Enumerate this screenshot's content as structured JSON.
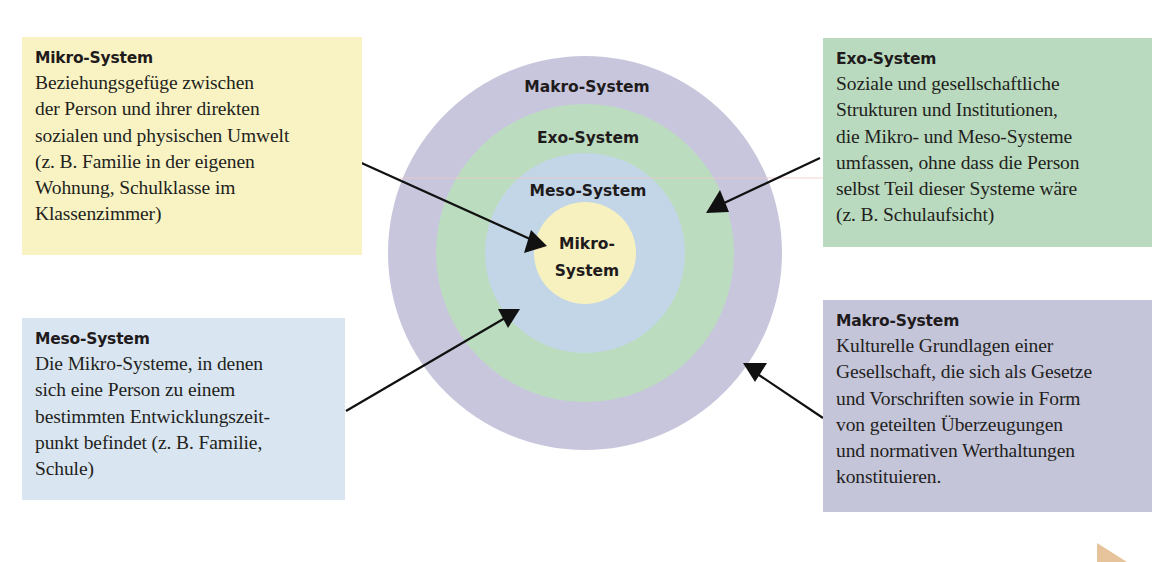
{
  "diagram": {
    "rings": [
      {
        "key": "makro",
        "label": "Makro-System",
        "color": "#c7c6dc",
        "radius": 197
      },
      {
        "key": "exo",
        "label": "Exo-System",
        "color": "#bcdcc0",
        "radius": 149
      },
      {
        "key": "meso",
        "label": "Meso-System",
        "color": "#c3d6e8",
        "radius": 100
      },
      {
        "key": "mikro",
        "label_line1": "Mikro-",
        "label_line2": "System",
        "color": "#f7f1c0",
        "radius": 51
      }
    ],
    "center": {
      "x": 585,
      "y": 253
    }
  },
  "boxes": {
    "mikro": {
      "title": "Mikro-System",
      "lines": [
        "Beziehungsgefüge zwischen",
        "der Person und ihrer direkten",
        "sozialen und physischen Umwelt",
        "(z. B. Familie in der eigenen",
        "Wohnung, Schulklasse im",
        "Klassenzimmer)"
      ],
      "color": "#f9f3c4"
    },
    "meso": {
      "title": "Meso-System",
      "lines": [
        "Die Mikro-Systeme, in denen",
        "sich eine Person zu einem",
        "bestimmten Entwicklungszeit-",
        "punkt befindet (z. B. Familie,",
        "Schule)"
      ],
      "color": "#d9e6f1"
    },
    "exo": {
      "title": "Exo-System",
      "lines": [
        "Soziale und gesellschaftliche",
        "Strukturen und Institutionen,",
        "die Mikro- und Meso-Systeme",
        "umfassen, ohne dass die Person",
        "selbst Teil dieser Systeme wäre",
        "(z. B. Schulaufsicht)"
      ],
      "color": "#b9dabe"
    },
    "makro": {
      "title": "Makro-System",
      "lines": [
        "Kulturelle Grundlagen einer",
        "Gesellschaft, die sich als Gesetze",
        "und Vorschriften sowie in Form",
        "von geteilten Überzeugungen",
        "und normativen Werthaltungen",
        "konstituieren."
      ],
      "color": "#c5c5da"
    }
  },
  "arrows": [
    {
      "from": "mikro-box",
      "to": "mikro-ring"
    },
    {
      "from": "meso-box",
      "to": "meso-ring"
    },
    {
      "from": "exo-box",
      "to": "exo-ring"
    },
    {
      "from": "makro-box",
      "to": "makro-ring"
    }
  ],
  "corner_marker": {
    "color": "#e6c39a"
  }
}
